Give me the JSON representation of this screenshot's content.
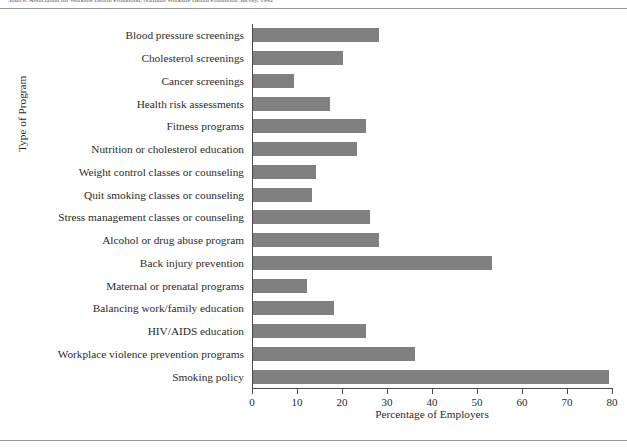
{
  "figure": {
    "caption": "Source: Association for Worksite Health Promotion, National Worksite Health Promotion Survey, 1992",
    "axis_title_y": "Type of Program",
    "axis_title_x": "Percentage of Employers",
    "bar_color": "#808080",
    "axis_color": "#4a4a4a",
    "rule_color": "#9a9a9a"
  },
  "chart_data": {
    "type": "bar",
    "orientation": "horizontal",
    "title": "",
    "xlabel": "Percentage of Employers",
    "ylabel": "Type of Program",
    "xlim": [
      0,
      80
    ],
    "xticks": [
      0,
      10,
      20,
      30,
      40,
      50,
      60,
      70,
      80
    ],
    "xtick_labels": [
      "0",
      "10",
      "20",
      "30",
      "40",
      "50",
      "60",
      "70",
      "80"
    ],
    "grid": false,
    "legend": false,
    "categories": [
      "Blood pressure screenings",
      "Cholesterol screenings",
      "Cancer screenings",
      "Health risk assessments",
      "Fitness programs",
      "Nutrition or cholesterol education",
      "Weight control classes or counseling",
      "Quit smoking classes or counseling",
      "Stress management classes or counseling",
      "Alcohol or drug abuse program",
      "Back injury prevention",
      "Maternal or prenatal programs",
      "Balancing work/family education",
      "HIV/AIDS education",
      "Workplace violence prevention programs",
      "Smoking policy"
    ],
    "values": [
      28,
      20,
      9,
      17,
      25,
      23,
      14,
      13,
      26,
      28,
      53,
      12,
      18,
      25,
      36,
      79
    ]
  }
}
